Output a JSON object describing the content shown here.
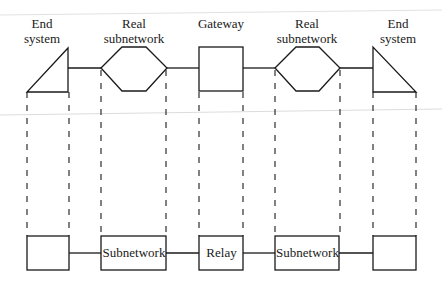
{
  "diagram": {
    "top_labels": [
      {
        "line1": "End",
        "line2": "system"
      },
      {
        "line1": "Real",
        "line2": "subnetwork"
      },
      {
        "line1": "Gateway",
        "line2": ""
      },
      {
        "line1": "Real",
        "line2": "subnetwork"
      },
      {
        "line1": "End",
        "line2": "system"
      }
    ],
    "bottom_boxes": [
      {
        "label": ""
      },
      {
        "label": "Subnetwork"
      },
      {
        "label": "Relay"
      },
      {
        "label": "Subnetwork"
      },
      {
        "label": ""
      }
    ],
    "colors": {
      "stroke": "#1a1a1a",
      "background": "#ffffff",
      "scan_line": "#d8d8d8"
    }
  }
}
